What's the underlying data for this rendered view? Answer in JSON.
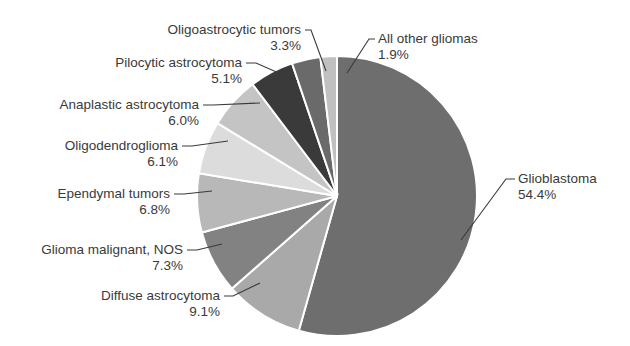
{
  "chart_data": {
    "type": "pie",
    "title": "",
    "start_angle_deg": 0,
    "direction": "clockwise",
    "center": [
      337,
      196
    ],
    "radius": 140,
    "slices": [
      {
        "label": "Glioblastoma",
        "value": 54.4,
        "display": "54.4%",
        "color": "#6e6e6e"
      },
      {
        "label": "Diffuse astrocytoma",
        "value": 9.1,
        "display": "9.1%",
        "color": "#a9a9a9"
      },
      {
        "label": "Glioma malignant, NOS",
        "value": 7.3,
        "display": "7.3%",
        "color": "#828282"
      },
      {
        "label": "Ependymal tumors",
        "value": 6.8,
        "display": "6.8%",
        "color": "#b8b8b8"
      },
      {
        "label": "Oligodendroglioma",
        "value": 6.1,
        "display": "6.1%",
        "color": "#dcdcdc"
      },
      {
        "label": "Anaplastic astrocytoma",
        "value": 6.0,
        "display": "6.0%",
        "color": "#c4c4c4"
      },
      {
        "label": "Pilocytic astrocytoma",
        "value": 5.1,
        "display": "5.1%",
        "color": "#3a3a3a"
      },
      {
        "label": "Oligoastrocytic tumors",
        "value": 3.3,
        "display": "3.3%",
        "color": "#6a6a6a"
      },
      {
        "label": "All other gliomas",
        "value": 1.9,
        "display": "1.9%",
        "color": "#c0c0c0"
      }
    ],
    "labels_layout": [
      {
        "name_xy": [
          518,
          183
        ],
        "pct_xy": [
          518,
          199
        ],
        "anchor": "start",
        "leader": [
          [
            515,
            179
          ],
          [
            506,
            179
          ],
          [
            461,
            240
          ]
        ]
      },
      {
        "name_xy": [
          220,
          300
        ],
        "pct_xy": [
          220,
          316
        ],
        "anchor": "end",
        "leader": [
          [
            224,
            296
          ],
          [
            233,
            296
          ],
          [
            260,
            283
          ]
        ]
      },
      {
        "name_xy": [
          183,
          254
        ],
        "pct_xy": [
          183,
          270
        ],
        "anchor": "end",
        "leader": [
          [
            187,
            250
          ],
          [
            197,
            250
          ],
          [
            222,
            244
          ]
        ]
      },
      {
        "name_xy": [
          170,
          198
        ],
        "pct_xy": [
          170,
          214
        ],
        "anchor": "end",
        "leader": [
          [
            174,
            194
          ],
          [
            184,
            194
          ],
          [
            212,
            191
          ]
        ]
      },
      {
        "name_xy": [
          178,
          150
        ],
        "pct_xy": [
          178,
          166
        ],
        "anchor": "end",
        "leader": [
          [
            182,
            146
          ],
          [
            192,
            146
          ],
          [
            228,
            141
          ]
        ]
      },
      {
        "name_xy": [
          199,
          109
        ],
        "pct_xy": [
          199,
          125
        ],
        "anchor": "end",
        "leader": [
          [
            203,
            105
          ],
          [
            213,
            105
          ],
          [
            260,
            103
          ]
        ]
      },
      {
        "name_xy": [
          242,
          67
        ],
        "pct_xy": [
          242,
          83
        ],
        "anchor": "end",
        "leader": [
          [
            246,
            63
          ],
          [
            256,
            63
          ],
          [
            297,
            81
          ]
        ]
      },
      {
        "name_xy": [
          301,
          34
        ],
        "pct_xy": [
          301,
          50
        ],
        "anchor": "end",
        "leader": [
          [
            305,
            30
          ],
          [
            311,
            30
          ],
          [
            326,
            71
          ]
        ]
      },
      {
        "name_xy": [
          378,
          43
        ],
        "pct_xy": [
          378,
          59
        ],
        "anchor": "start",
        "leader": [
          [
            375,
            39
          ],
          [
            369,
            39
          ],
          [
            347,
            73
          ]
        ]
      }
    ]
  }
}
